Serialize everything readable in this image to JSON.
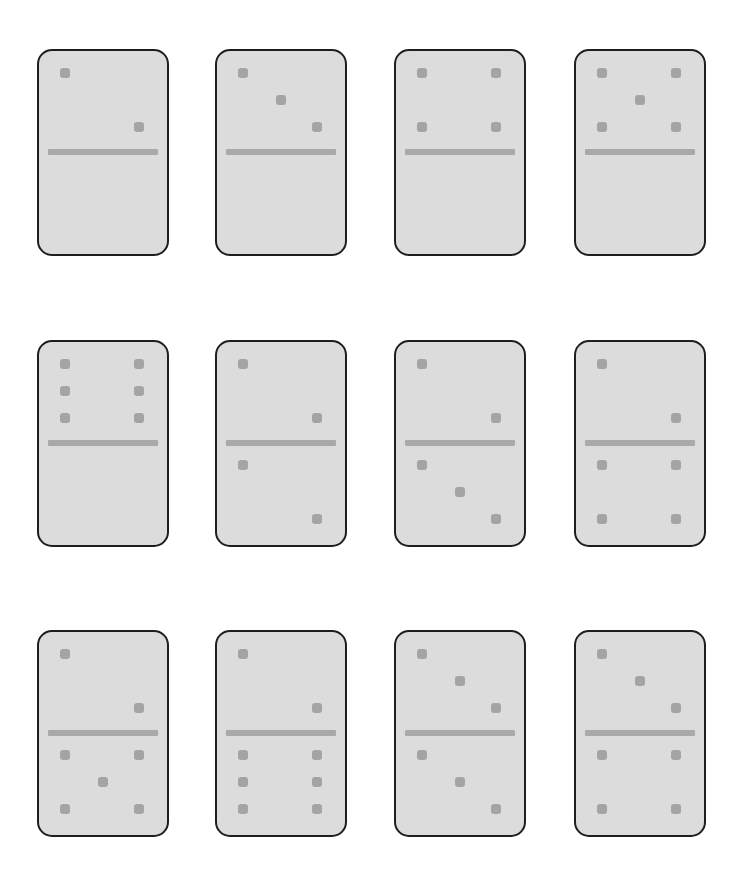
{
  "board": {
    "colors": {
      "background": "#ffffff",
      "face": "#dcdcdc",
      "border": "#1e1e1e",
      "pip": "#a4a4a4",
      "divider": "#a9a9a9"
    },
    "dominoes": [
      {
        "top": 2,
        "bottom": 0,
        "label": "2|0"
      },
      {
        "top": 3,
        "bottom": 0,
        "label": "3|0"
      },
      {
        "top": 4,
        "bottom": 0,
        "label": "4|0"
      },
      {
        "top": 5,
        "bottom": 0,
        "label": "5|0"
      },
      {
        "top": 6,
        "bottom": 0,
        "label": "6|0"
      },
      {
        "top": 2,
        "bottom": 2,
        "label": "2|2"
      },
      {
        "top": 2,
        "bottom": 3,
        "label": "2|3"
      },
      {
        "top": 2,
        "bottom": 4,
        "label": "2|4"
      },
      {
        "top": 2,
        "bottom": 5,
        "label": "2|5"
      },
      {
        "top": 2,
        "bottom": 6,
        "label": "2|6"
      },
      {
        "top": 3,
        "bottom": 3,
        "label": "3|3"
      },
      {
        "top": 3,
        "bottom": 4,
        "label": "3|4"
      }
    ]
  }
}
